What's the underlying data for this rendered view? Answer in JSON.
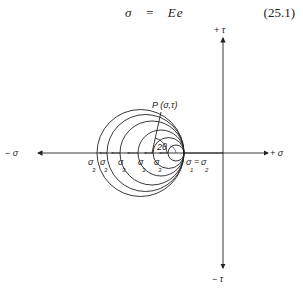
{
  "equation": {
    "sigma": "σ",
    "equals": "=",
    "rhs": "Ee",
    "number": "(25.1)"
  },
  "diagram": {
    "axes": {
      "pos_sigma": "+ σ",
      "neg_sigma": "− σ",
      "pos_tau": "+ τ",
      "neg_tau": "− τ"
    },
    "point_label": "P (σ,τ)",
    "angle_label": "2θ",
    "sigma3_label": "σ",
    "sigma3_sub": "3",
    "sigma12_label": "σ",
    "sigma12_sub1": "1",
    "equals": "=",
    "sigma12_sub2": "2",
    "circle_count": 6
  }
}
